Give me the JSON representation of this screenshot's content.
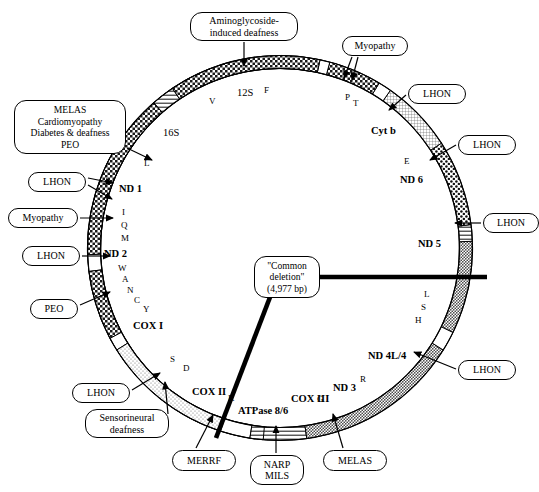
{
  "figure": {
    "type": "diagram",
    "genome_circle": {
      "center_x": 280,
      "center_y": 248,
      "radius": 186,
      "ring_thickness": 13
    }
  },
  "genes": [
    {
      "name": "12S",
      "label": "12S",
      "style": "rna",
      "x": 237,
      "y": 88,
      "fill": "checker-dark"
    },
    {
      "name": "16S",
      "label": "16S",
      "style": "rna",
      "x": 163,
      "y": 128,
      "fill": "checker-dark"
    },
    {
      "name": "ND1",
      "label": "ND 1",
      "style": "gene",
      "x": 119,
      "y": 184,
      "fill": "checker-mid"
    },
    {
      "name": "ND2",
      "label": "ND 2",
      "style": "gene",
      "x": 104,
      "y": 249,
      "fill": "checker-mid"
    },
    {
      "name": "COX1",
      "label": "COX I",
      "style": "gene",
      "x": 133,
      "y": 321,
      "fill": "stipple-mid"
    },
    {
      "name": "COX2",
      "label": "COX II",
      "style": "gene",
      "x": 192,
      "y": 387,
      "fill": "stipple-mid"
    },
    {
      "name": "ATPase86",
      "label": "ATPase 8/6",
      "style": "gene",
      "x": 238,
      "y": 406,
      "fill": "dots"
    },
    {
      "name": "COX3",
      "label": "COX III",
      "style": "gene",
      "x": 291,
      "y": 394,
      "fill": "grid-fine"
    },
    {
      "name": "ND3",
      "label": "ND 3",
      "style": "gene",
      "x": 333,
      "y": 383,
      "fill": "checker-mid"
    },
    {
      "name": "ND4L4",
      "label": "ND 4L/4",
      "style": "gene",
      "x": 368,
      "y": 351,
      "fill": "checker-mid"
    },
    {
      "name": "ND5",
      "label": "ND 5",
      "style": "gene",
      "x": 418,
      "y": 239,
      "fill": "checker-mid"
    },
    {
      "name": "ND6",
      "label": "ND 6",
      "style": "gene",
      "x": 400,
      "y": 175,
      "fill": "checker-mid"
    },
    {
      "name": "CytB",
      "label": "Cyt b",
      "style": "gene",
      "x": 371,
      "y": 126,
      "fill": "stipple-light"
    }
  ],
  "trnas": [
    {
      "name": "F",
      "label": "F",
      "x": 264,
      "y": 86
    },
    {
      "name": "V",
      "label": "V",
      "x": 209,
      "y": 97
    },
    {
      "name": "L-leu-UUR",
      "label": "L",
      "x": 144,
      "y": 159
    },
    {
      "name": "I",
      "label": "I",
      "x": 122,
      "y": 208
    },
    {
      "name": "Q",
      "label": "Q",
      "x": 121,
      "y": 221
    },
    {
      "name": "M",
      "label": "M",
      "x": 121,
      "y": 234
    },
    {
      "name": "W",
      "label": "W",
      "x": 118,
      "y": 264
    },
    {
      "name": "A",
      "label": "A",
      "x": 122,
      "y": 275
    },
    {
      "name": "N",
      "label": "N",
      "x": 127,
      "y": 286
    },
    {
      "name": "C",
      "label": "C",
      "x": 134,
      "y": 296
    },
    {
      "name": "Y",
      "label": "Y",
      "x": 143,
      "y": 305
    },
    {
      "name": "S-ser-UCN",
      "label": "S",
      "x": 170,
      "y": 355
    },
    {
      "name": "D",
      "label": "D",
      "x": 183,
      "y": 364
    },
    {
      "name": "K",
      "label": "K",
      "x": 228,
      "y": 394
    },
    {
      "name": "G",
      "label": "G",
      "x": 317,
      "y": 395
    },
    {
      "name": "R",
      "label": "R",
      "x": 360,
      "y": 375
    },
    {
      "name": "L-leu-CUN",
      "label": "L",
      "x": 424,
      "y": 290
    },
    {
      "name": "S-ser-AGY",
      "label": "S",
      "x": 421,
      "y": 303
    },
    {
      "name": "H",
      "label": "H",
      "x": 415,
      "y": 316
    },
    {
      "name": "E",
      "label": "E",
      "x": 404,
      "y": 157
    },
    {
      "name": "P",
      "label": "P",
      "x": 345,
      "y": 93
    },
    {
      "name": "T",
      "label": "T",
      "x": 353,
      "y": 99
    }
  ],
  "callouts": [
    {
      "id": "aminoglycoside",
      "lines": [
        "Aminoglycoside-",
        "induced deafness"
      ],
      "x": 190,
      "y": 12,
      "w": 108,
      "h": 28
    },
    {
      "id": "melas-group",
      "lines": [
        "MELAS",
        "Cardiomyopathy",
        "Diabetes & deafness",
        "PEO"
      ],
      "x": 14,
      "y": 100,
      "w": 112,
      "h": 54
    },
    {
      "id": "lhon-nd1",
      "lines": [
        "LHON"
      ],
      "x": 28,
      "y": 172,
      "w": 58,
      "h": 20
    },
    {
      "id": "myopathy-left",
      "lines": [
        "Myopathy"
      ],
      "x": 8,
      "y": 208,
      "w": 70,
      "h": 20
    },
    {
      "id": "lhon-nd2",
      "lines": [
        "LHON"
      ],
      "x": 22,
      "y": 246,
      "w": 58,
      "h": 20
    },
    {
      "id": "peo",
      "lines": [
        "PEO"
      ],
      "x": 30,
      "y": 299,
      "w": 48,
      "h": 20
    },
    {
      "id": "lhon-cox1",
      "lines": [
        "LHON"
      ],
      "x": 72,
      "y": 383,
      "w": 58,
      "h": 20
    },
    {
      "id": "sensorineural",
      "lines": [
        "Sensorineural",
        "deafness"
      ],
      "x": 85,
      "y": 409,
      "w": 84,
      "h": 29
    },
    {
      "id": "merrf",
      "lines": [
        "MERRF"
      ],
      "x": 172,
      "y": 450,
      "w": 64,
      "h": 21
    },
    {
      "id": "narp-mils",
      "lines": [
        "NARP",
        "MILS"
      ],
      "x": 250,
      "y": 455,
      "w": 54,
      "h": 30
    },
    {
      "id": "melas-bottom",
      "lines": [
        "MELAS"
      ],
      "x": 323,
      "y": 450,
      "w": 64,
      "h": 21
    },
    {
      "id": "lhon-nd4",
      "lines": [
        "LHON"
      ],
      "x": 458,
      "y": 360,
      "w": 58,
      "h": 20
    },
    {
      "id": "lhon-nd5",
      "lines": [
        "LHON"
      ],
      "x": 483,
      "y": 213,
      "w": 56,
      "h": 20
    },
    {
      "id": "lhon-nd6",
      "lines": [
        "LHON"
      ],
      "x": 458,
      "y": 135,
      "w": 58,
      "h": 20
    },
    {
      "id": "lhon-cytb",
      "lines": [
        "LHON"
      ],
      "x": 408,
      "y": 84,
      "w": 58,
      "h": 20
    },
    {
      "id": "myopathy-right",
      "lines": [
        "Myopathy"
      ],
      "x": 342,
      "y": 36,
      "w": 66,
      "h": 20
    },
    {
      "id": "common-deletion",
      "lines": [
        "\"Common",
        "deletion\"",
        "(4,977 bp)"
      ],
      "x": 254,
      "y": 256,
      "w": 66,
      "h": 42
    }
  ],
  "deletion_marker": {
    "label": "\"Common deletion\" (4,977 bp)",
    "bp": "4,977 bp"
  },
  "colors": {
    "ink": "#000000",
    "paper": "#ffffff",
    "ring_light": "#d8d8d8",
    "ring_mid": "#9a9a9a",
    "ring_dark": "#3a3a3a"
  }
}
